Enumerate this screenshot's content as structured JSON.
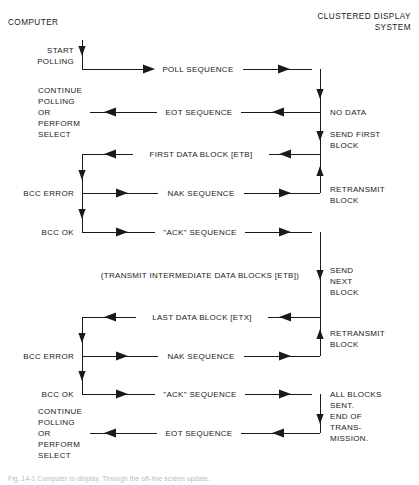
{
  "figure": {
    "headers": {
      "left": "COMPUTER",
      "right_line1": "CLUSTERED DISPLAY",
      "right_line2": "SYSTEM"
    },
    "caption": "Fig. 14-1  Computer to display. Through the off-line screen update."
  },
  "messages": [
    {
      "id": "poll-sequence",
      "label": "POLL SEQUENCE",
      "direction": "right",
      "y": 69
    },
    {
      "id": "eot-sequence-1",
      "label": "EOT SEQUENCE",
      "direction": "left",
      "y": 112
    },
    {
      "id": "first-data-block",
      "label": "FIRST DATA BLOCK [ETB]",
      "direction": "left",
      "y": 154
    },
    {
      "id": "nak-sequence-1",
      "label": "NAK SEQUENCE",
      "direction": "right",
      "y": 193
    },
    {
      "id": "ack-sequence-1",
      "label": "\"ACK\" SEQUENCE",
      "direction": "right",
      "y": 232
    },
    {
      "id": "last-data-block",
      "label": "LAST DATA BLOCK [ETX]",
      "direction": "left",
      "y": 317
    },
    {
      "id": "nak-sequence-2",
      "label": "NAK SEQUENCE",
      "direction": "right",
      "y": 356
    },
    {
      "id": "ack-sequence-2",
      "label": "\"ACK\" SEQUENCE",
      "direction": "right",
      "y": 394
    },
    {
      "id": "eot-sequence-2",
      "label": "EOT SEQUENCE",
      "direction": "left",
      "y": 433
    }
  ],
  "intermediate_note": {
    "label": "(TRANSMIT INTERMEDIATE DATA BLOCKS [ETB])",
    "y": 275
  },
  "computer_states": [
    {
      "id": "start-polling",
      "lines": [
        "START",
        "POLLING"
      ],
      "y": 50,
      "align": "right"
    },
    {
      "id": "continue-1",
      "lines": [
        "CONTINUE",
        "POLLING",
        "OR",
        "PERFORM",
        "SELECT"
      ],
      "y": 90,
      "align": "left"
    },
    {
      "id": "bcc-error-1",
      "lines": [
        "BCC ERROR"
      ],
      "y": 190,
      "align": "left"
    },
    {
      "id": "bcc-ok-1",
      "lines": [
        "BCC OK"
      ],
      "y": 229,
      "align": "right"
    },
    {
      "id": "bcc-error-2",
      "lines": [
        "BCC ERROR"
      ],
      "y": 353,
      "align": "left"
    },
    {
      "id": "bcc-ok-2",
      "lines": [
        "BCC OK"
      ],
      "y": 391,
      "align": "right"
    },
    {
      "id": "continue-2",
      "lines": [
        "CONTINUE",
        "POLLING",
        "OR",
        "PERFORM",
        "SELECT"
      ],
      "y": 412,
      "align": "left"
    }
  ],
  "display_states": [
    {
      "id": "no-data",
      "lines": [
        "NO DATA"
      ],
      "y": 109
    },
    {
      "id": "send-first-block",
      "lines": [
        "SEND FIRST",
        "BLOCK"
      ],
      "y": 131
    },
    {
      "id": "retransmit-1",
      "lines": [
        "RETRANSMIT",
        "BLOCK"
      ],
      "y": 186
    },
    {
      "id": "send-next-block",
      "lines": [
        "SEND",
        "NEXT",
        "BLOCK"
      ],
      "y": 267
    },
    {
      "id": "retransmit-2",
      "lines": [
        "RETRANSMIT",
        "BLOCK"
      ],
      "y": 330
    },
    {
      "id": "end-of-transmission",
      "lines": [
        "ALL BLOCKS",
        "SENT.",
        "END OF",
        "TRANS-",
        "MISSION."
      ],
      "y": 391
    }
  ],
  "geometry": {
    "computer_rail_x": 82,
    "display_rail_x": 320,
    "label_gap": 8
  },
  "colors": {
    "ink": "#1a1a1a",
    "paper": "#ffffff",
    "caption": "#b9b9b9"
  }
}
